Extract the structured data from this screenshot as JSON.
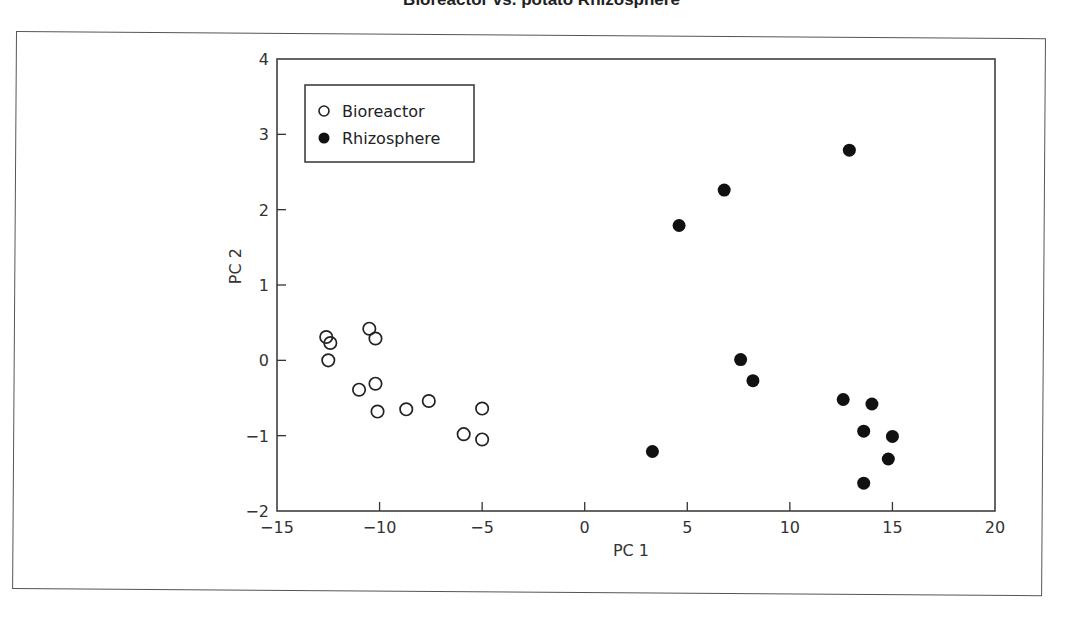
{
  "title": "Bioreactor vs. potato Rhizosphere",
  "chart_data": {
    "type": "scatter",
    "title": "Bioreactor vs. potato Rhizosphere",
    "xlabel": "PC 1",
    "ylabel": "PC 2",
    "xlim": [
      -15,
      20
    ],
    "ylim": [
      -2,
      4
    ],
    "xticks": [
      -15,
      -10,
      -5,
      0,
      5,
      10,
      15,
      20
    ],
    "yticks": [
      -2,
      -1,
      0,
      1,
      2,
      3,
      4
    ],
    "xtick_labels": [
      "−15",
      "−10",
      "−5",
      "0",
      "5",
      "10",
      "15",
      "20"
    ],
    "ytick_labels": [
      "−2",
      "−1",
      "0",
      "1",
      "2",
      "3",
      "4"
    ],
    "grid": false,
    "legend_position": "upper left",
    "series": [
      {
        "name": "Bioreactor",
        "marker": "open-circle",
        "color": "#222222",
        "points": [
          [
            -12.6,
            0.31
          ],
          [
            -12.4,
            0.23
          ],
          [
            -12.5,
            0.0
          ],
          [
            -10.5,
            0.42
          ],
          [
            -10.2,
            0.29
          ],
          [
            -11.0,
            -0.39
          ],
          [
            -10.2,
            -0.31
          ],
          [
            -10.1,
            -0.68
          ],
          [
            -8.7,
            -0.65
          ],
          [
            -7.6,
            -0.54
          ],
          [
            -5.9,
            -0.98
          ],
          [
            -5.0,
            -0.64
          ],
          [
            -5.0,
            -1.05
          ]
        ]
      },
      {
        "name": "Rhizosphere",
        "marker": "filled-circle",
        "color": "#111111",
        "points": [
          [
            4.6,
            1.79
          ],
          [
            6.8,
            2.26
          ],
          [
            12.9,
            2.79
          ],
          [
            7.6,
            0.01
          ],
          [
            8.2,
            -0.27
          ],
          [
            3.3,
            -1.21
          ],
          [
            12.6,
            -0.52
          ],
          [
            14.0,
            -0.58
          ],
          [
            13.6,
            -0.94
          ],
          [
            15.0,
            -1.01
          ],
          [
            14.8,
            -1.31
          ],
          [
            13.6,
            -1.63
          ]
        ]
      }
    ]
  },
  "legend": {
    "items": [
      {
        "label": "Bioreactor"
      },
      {
        "label": "Rhizosphere"
      }
    ]
  }
}
